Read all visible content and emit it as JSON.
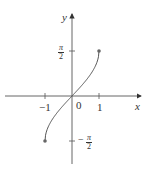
{
  "chart_data": {
    "type": "line",
    "title": "",
    "function": "y = arcsin(x)",
    "xlabel": "x",
    "ylabel": "y",
    "x_ticks": [
      -1,
      0,
      1
    ],
    "x_tick_labels": [
      "−1",
      "0",
      "1"
    ],
    "y_ticks": [
      -1.5708,
      1.5708
    ],
    "y_tick_labels": [
      "−π/2",
      "π/2"
    ],
    "xlim": [
      -1.6,
      2.0
    ],
    "ylim": [
      -1.8,
      2.0
    ],
    "grid": false,
    "legend": null,
    "series": [
      {
        "name": "arcsin",
        "x": [
          -1,
          -0.9,
          -0.75,
          -0.5,
          -0.25,
          0,
          0.25,
          0.5,
          0.75,
          0.9,
          1
        ],
        "y": [
          -1.5708,
          -1.1198,
          -0.8481,
          -0.5236,
          -0.2527,
          0,
          0.2527,
          0.5236,
          0.8481,
          1.1198,
          1.5708
        ],
        "endpoints": [
          [
            -1,
            -1.5708
          ],
          [
            1,
            1.5708
          ]
        ]
      }
    ],
    "colors": {
      "axis": "#444444",
      "curve": "#555555",
      "point": "#666666"
    }
  },
  "labels": {
    "x_axis": "x",
    "y_axis": "y",
    "origin": "0",
    "x_neg1": "−1",
    "x_pos1": "1",
    "pi": "π",
    "two": "2",
    "minus": "−"
  }
}
